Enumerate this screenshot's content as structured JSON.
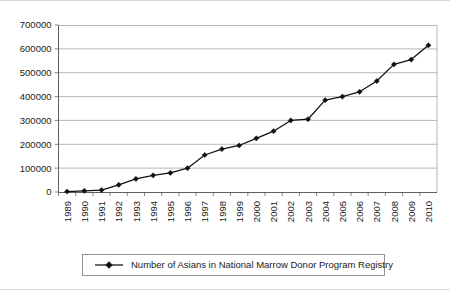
{
  "chart_data": {
    "type": "line",
    "title": "",
    "xlabel": "",
    "ylabel": "",
    "grid": true,
    "legend_position": "bottom",
    "ylim": [
      0,
      700000
    ],
    "ytick_labels": [
      "0",
      "100000",
      "200000",
      "300000",
      "400000",
      "500000",
      "600000",
      "700000"
    ],
    "ytick_values": [
      0,
      100000,
      200000,
      300000,
      400000,
      500000,
      600000,
      700000
    ],
    "categories": [
      "1989",
      "1990",
      "1991",
      "1992",
      "1993",
      "1994",
      "1995",
      "1996",
      "1997",
      "1998",
      "1999",
      "2000",
      "2001",
      "2002",
      "2003",
      "2004",
      "2005",
      "2006",
      "2007",
      "2008",
      "2009",
      "2010"
    ],
    "series": [
      {
        "name": "Number of Asians in National Marrow Donor Program Registry",
        "color": "#111111",
        "marker": "diamond",
        "values": [
          2000,
          5000,
          8000,
          30000,
          55000,
          70000,
          80000,
          100000,
          155000,
          180000,
          195000,
          225000,
          255000,
          300000,
          305000,
          385000,
          400000,
          420000,
          465000,
          535000,
          555000,
          615000
        ]
      }
    ]
  },
  "legend": {
    "entries": [
      {
        "label": "Number of Asians in National Marrow Donor Program Registry"
      }
    ]
  }
}
